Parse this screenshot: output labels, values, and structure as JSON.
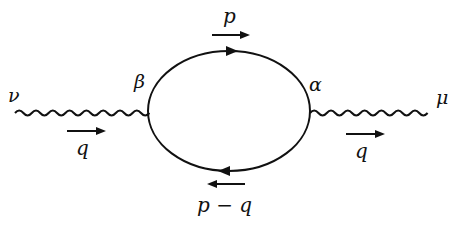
{
  "diagram": {
    "type": "feynman-diagram",
    "labels": {
      "left_index": "ν",
      "right_index": "μ",
      "left_vertex": "β",
      "right_vertex": "α",
      "top_momentum": "p",
      "bottom_momentum": "p − q",
      "left_external_momentum": "q",
      "right_external_momentum": "q"
    },
    "colors": {
      "line": "#111111",
      "background": "#ffffff"
    }
  }
}
